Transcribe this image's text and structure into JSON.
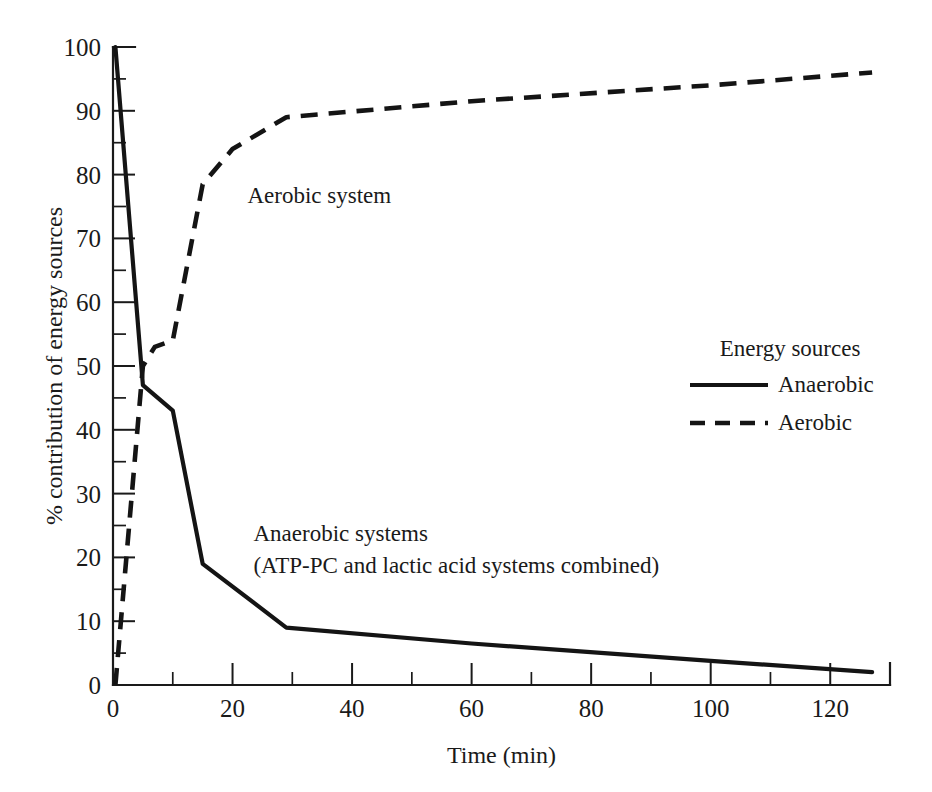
{
  "chart_data": {
    "type": "line",
    "title": "",
    "xlabel": "Time (min)",
    "ylabel": "% contribution of energy sources",
    "xlim": [
      0,
      130
    ],
    "ylim": [
      0,
      100
    ],
    "grid": false,
    "x_ticks_major": [
      0,
      20,
      40,
      60,
      80,
      100,
      120
    ],
    "x_ticks_minor": [
      10,
      30,
      50,
      70,
      90,
      110
    ],
    "y_ticks_major": [
      0,
      10,
      20,
      30,
      40,
      50,
      60,
      70,
      80,
      90,
      100
    ],
    "y_ticks_minor": [
      5,
      15,
      25,
      35,
      45,
      55,
      65,
      75,
      85,
      95
    ],
    "legend_position": "right-middle",
    "legend_title": "Energy sources",
    "series": [
      {
        "name": "Anaerobic",
        "style": "solid",
        "color": "#141414",
        "x": [
          0.4,
          5,
          10,
          15,
          29,
          60,
          100,
          127
        ],
        "y": [
          100,
          47,
          43,
          19,
          9,
          6.5,
          3.8,
          2
        ]
      },
      {
        "name": "Aerobic",
        "style": "dashed",
        "color": "#141414",
        "x": [
          0.4,
          5,
          7,
          10,
          15,
          20,
          29,
          60,
          100,
          127
        ],
        "y": [
          0,
          50,
          53,
          54,
          78.5,
          84,
          89,
          91.5,
          94,
          96
        ]
      }
    ],
    "annotations": [
      {
        "id": "aerobic-label",
        "text": "Aerobic system",
        "x": 22.5,
        "y": 75.5
      },
      {
        "id": "anaerobic-label-line1",
        "text": "Anaerobic systems",
        "x": 23.5,
        "y": 22.5
      },
      {
        "id": "anaerobic-label-line2",
        "text": "(ATP-PC and lactic acid systems combined)",
        "x": 23.5,
        "y": 17.5
      }
    ]
  },
  "legend": {
    "title": "Energy sources",
    "entries": [
      {
        "label": "Anaerobic",
        "style": "solid"
      },
      {
        "label": "Aerobic",
        "style": "dashed"
      }
    ]
  },
  "axes": {
    "x_title": "Time (min)",
    "y_title": "% contribution of energy sources",
    "x_tick_labels": [
      "0",
      "20",
      "40",
      "60",
      "80",
      "100",
      "120"
    ],
    "y_tick_labels": [
      "0",
      "10",
      "20",
      "30",
      "40",
      "50",
      "60",
      "70",
      "80",
      "90",
      "100"
    ]
  },
  "annotations": {
    "aerobic_system": "Aerobic system",
    "anaerobic_line1": "Anaerobic systems",
    "anaerobic_line2": "(ATP-PC and lactic acid systems combined)"
  },
  "colors": {
    "ink": "#141414",
    "background": "#ffffff"
  }
}
